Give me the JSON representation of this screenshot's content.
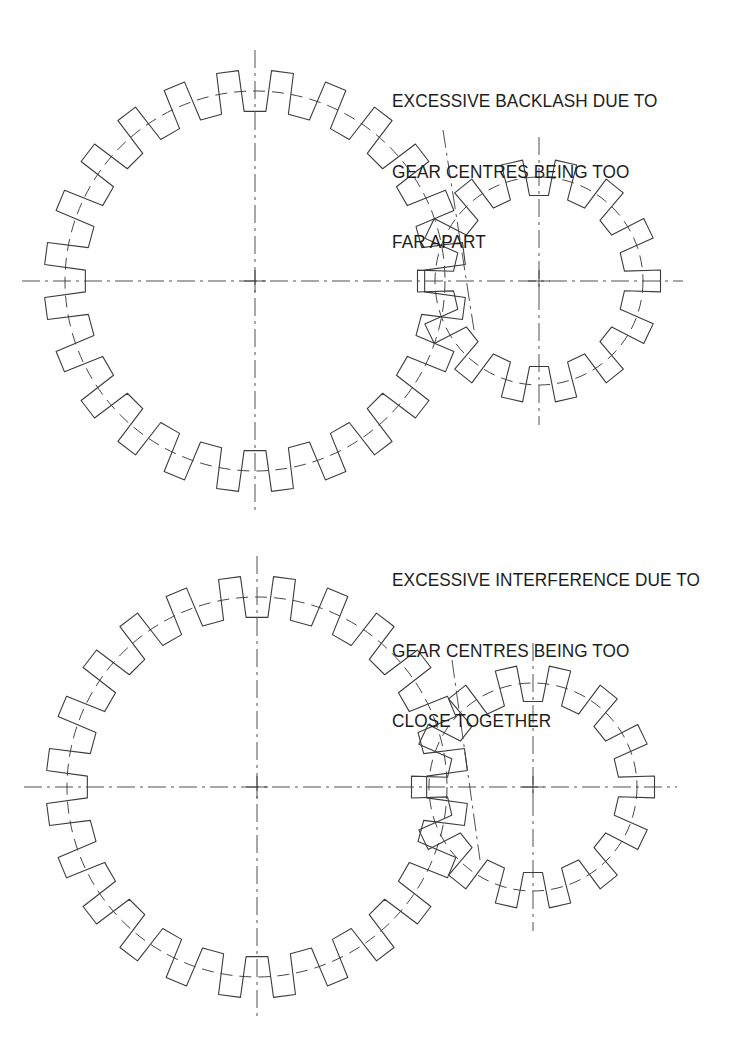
{
  "document": {
    "type": "engineering-drawing",
    "subject": "Spur gear meshing faults",
    "background_color": "#ffffff",
    "line_color": "#3c3c3c",
    "text_color": "#1d1d1d"
  },
  "annotations": {
    "backlash": {
      "name": "excessive-backlash-note",
      "lines": [
        "EXCESSIVE BACKLASH DUE TO",
        "GEAR CENTRES BEING TOO",
        "FAR APART"
      ],
      "x": 392,
      "y": 42
    },
    "interference": {
      "name": "excessive-interference-note",
      "lines": [
        "EXCESSIVE INTERFERENCE DUE TO",
        "GEAR CENTRES BEING TOO",
        "CLOSE TOGETHER"
      ],
      "x": 392,
      "y": 521
    }
  },
  "chart_data": {
    "type": "diagram",
    "views": [
      {
        "id": "upper",
        "fault": "excessive backlash",
        "cause": "gear centres too far apart",
        "gears": [
          {
            "role": "driver-large-gear",
            "teeth": 24,
            "center": [
              255,
              281
            ],
            "outer_radius": 211,
            "pitch_radius": 190,
            "root_radius": 170,
            "phase_deg": 7.5
          },
          {
            "role": "driven-small-gear",
            "teeth": 14,
            "center": [
              539,
              281
            ],
            "outer_radius": 122,
            "pitch_radius": 104,
            "root_radius": 86,
            "phase_deg": 12.85
          }
        ],
        "center_distance": 284,
        "nominal_center_distance": 294,
        "centerlines": {
          "horizontal_y": 281,
          "vertical_large_x": 255,
          "vertical_small_x": 539,
          "inclined": {
            "x1": 443,
            "y1": 130,
            "x2": 474,
            "y2": 330
          }
        }
      },
      {
        "id": "lower",
        "fault": "excessive interference",
        "cause": "gear centres too close together",
        "gears": [
          {
            "role": "driver-large-gear",
            "teeth": 24,
            "center": [
              257,
              787
            ],
            "outer_radius": 211,
            "pitch_radius": 190,
            "root_radius": 170,
            "phase_deg": 7.5
          },
          {
            "role": "driven-small-gear",
            "teeth": 14,
            "center": [
              533,
              787
            ],
            "outer_radius": 122,
            "pitch_radius": 104,
            "root_radius": 86,
            "phase_deg": 12.85
          }
        ],
        "center_distance": 276,
        "nominal_center_distance": 294,
        "centerlines": {
          "horizontal_y": 787,
          "vertical_large_x": 257,
          "vertical_small_x": 533,
          "inclined": {
            "x1": 452,
            "y1": 660,
            "x2": 480,
            "y2": 860
          }
        }
      }
    ],
    "linework": {
      "outline_width": 1.1,
      "pitch_circle_dash": "12,7",
      "centerline_dash": "18,5,3,5"
    }
  }
}
